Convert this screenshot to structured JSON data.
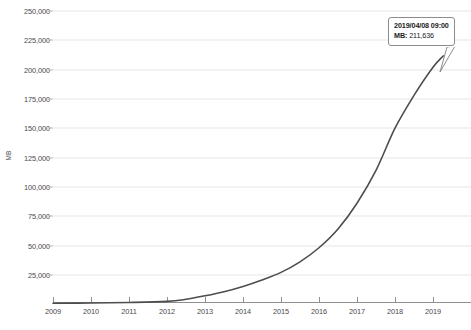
{
  "chart_data": {
    "type": "line",
    "title": "",
    "xlabel": "",
    "ylabel": "MB",
    "ylim": [
      0,
      250000
    ],
    "xlim": [
      2009,
      2019.5
    ],
    "grid": true,
    "legend": "none",
    "y_ticks": [
      "25,000",
      "50,000",
      "75,000",
      "100,000",
      "125,000",
      "150,000",
      "175,000",
      "200,000",
      "225,000",
      "250,000"
    ],
    "y_tick_values": [
      25000,
      50000,
      75000,
      100000,
      125000,
      150000,
      175000,
      200000,
      225000,
      250000
    ],
    "x_ticks": [
      "2009",
      "2010",
      "2011",
      "2012",
      "2013",
      "2014",
      "2015",
      "2016",
      "2017",
      "2018",
      "2019"
    ],
    "x_tick_values": [
      2009,
      2010,
      2011,
      2012,
      2013,
      2014,
      2015,
      2016,
      2017,
      2018,
      2019
    ],
    "series": [
      {
        "name": "MB",
        "color": "#4d4d4d",
        "x": [
          2009,
          2010,
          2011,
          2012,
          2012.5,
          2013,
          2013.5,
          2014,
          2014.5,
          2015,
          2015.5,
          2016,
          2016.5,
          2017,
          2017.5,
          2018,
          2018.5,
          2019,
          2019.27
        ],
        "values": [
          600,
          900,
          1300,
          2200,
          4000,
          7000,
          10500,
          15000,
          20500,
          27000,
          36000,
          48000,
          64000,
          86000,
          114000,
          150000,
          178000,
          202000,
          211636
        ]
      }
    ],
    "annotations": [
      {
        "name": "hover-tooltip",
        "date": "2019/04/08 09:00",
        "value_label": "MB:",
        "value": "211,636",
        "anchor_x": 2019.27,
        "anchor_y": 211636
      }
    ]
  },
  "axis": {
    "y_title": "MB"
  }
}
